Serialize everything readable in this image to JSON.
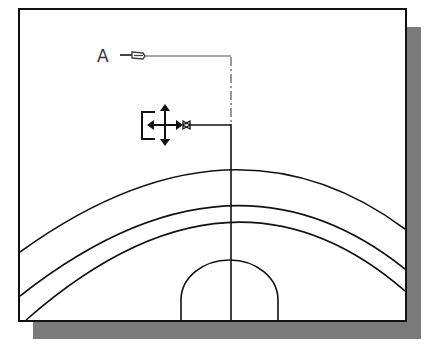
{
  "diagram": {
    "colors": {
      "background": "#ffffff",
      "frame": "#111111",
      "shadow": "#7a7a7a",
      "line": "#111111",
      "leader": "#555555"
    },
    "frame": {
      "x": 19,
      "y": 9,
      "width": 387,
      "height": 312
    },
    "shadow": {
      "offset_x": 14,
      "offset_y": 18
    },
    "section_label": {
      "text": "A",
      "x": 97,
      "y": 55
    },
    "center_line": {
      "x": 231
    },
    "arcs": [
      {
        "name": "outer-arc",
        "left_y": 252,
        "top_y": 175,
        "right_y": 229
      },
      {
        "name": "middle-arc",
        "left_y": 296,
        "top_y": 209,
        "right_y": 269
      },
      {
        "name": "inner-arc",
        "left_x": 26,
        "left_y": 320,
        "top_y": 227,
        "right_y": 291
      }
    ],
    "semicircle": {
      "left_x": 181,
      "right_x": 278,
      "top_y": 260,
      "base_y": 321
    },
    "cursor": {
      "icon": "move-grip-icon",
      "center_x": 165,
      "center_y": 125
    }
  }
}
